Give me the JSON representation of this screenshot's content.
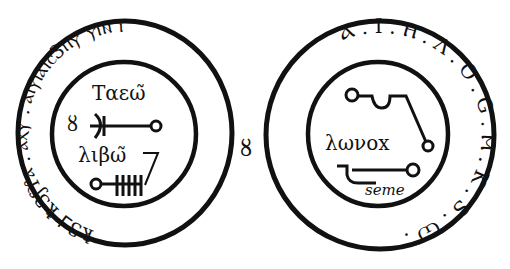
{
  "image": {
    "description": "Two circular talismanic seals drawn in black ink on white",
    "colors": {
      "ink": "#111111",
      "background": "#ffffff"
    }
  },
  "separator_glyph": "ȣ",
  "left_seal": {
    "ring_text": "ꝁ3⅃ ꝁ3ʃϒⲁ . ⲁⲭⲩ . ⲁⲓⲩⲓⲁⲓⲥ3ⲡⲩ ⲩⲓⲛ ⲓ",
    "inner": {
      "line1": "Ταεω̃",
      "side_glyph": "ȣ",
      "line2": "λιβω̃",
      "bars_count": 5
    }
  },
  "right_seal": {
    "ring_text": "Ⲁ . I . Ⲏ . Λ . O . G . Ⲙ . K . S . Ѡ̃ .",
    "inner": {
      "word": "λωνοx",
      "caption": "seme"
    }
  }
}
